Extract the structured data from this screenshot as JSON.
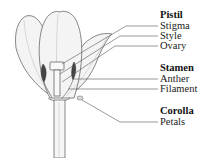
{
  "diagram": {
    "groups": [
      {
        "heading": "Pistil",
        "parts": [
          "Stigma",
          "Style",
          "Ovary"
        ]
      },
      {
        "heading": "Stamen",
        "parts": [
          "Anther",
          "Filament"
        ]
      },
      {
        "heading": "Corolla",
        "parts": [
          "Petals"
        ]
      }
    ]
  },
  "labels": {
    "pistil": "Pistil",
    "stigma": "Stigma",
    "style": "Style",
    "ovary": "Ovary",
    "stamen": "Stamen",
    "anther": "Anther",
    "filament": "Filament",
    "corolla": "Corolla",
    "petals": "Petals"
  },
  "colors": {
    "line": "#555555",
    "fill": "#f2f2f2",
    "text": "#222222"
  }
}
